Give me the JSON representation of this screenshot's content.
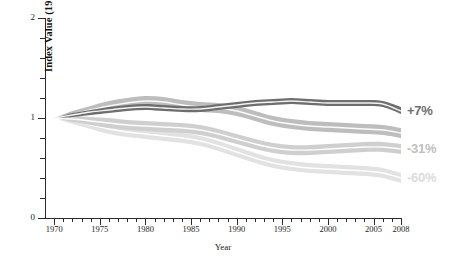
{
  "chart_data": {
    "type": "area",
    "title": "",
    "subtitle": "",
    "xlabel": "Year",
    "ylabel": "Index Value (1970 = 1)",
    "xlim": [
      1969,
      2008
    ],
    "ylim": [
      0,
      2
    ],
    "grid": false,
    "legend_position": "right-endpoint-labels",
    "y_ticks_major": [
      0,
      1,
      2
    ],
    "y_tick_labels": [
      "0",
      "1",
      "2"
    ],
    "y_ticks_minor": [
      0.2,
      0.4,
      0.6,
      0.8,
      1.2,
      1.4,
      1.6,
      1.8
    ],
    "x_ticks_major": [
      1970,
      1975,
      1980,
      1985,
      1990,
      1995,
      2000,
      2005,
      2008
    ],
    "x_tick_labels": [
      "1970",
      "1975",
      "1980",
      "1985",
      "1990",
      "1995",
      "2000",
      "2005",
      "2008"
    ],
    "x_ticks_minor_step": 1,
    "x": [
      1970,
      1972,
      1974,
      1976,
      1978,
      1980,
      1982,
      1984,
      1986,
      1988,
      1990,
      1992,
      1994,
      1996,
      1998,
      2000,
      2002,
      2004,
      2006,
      2008
    ],
    "series": [
      {
        "name": "band-1",
        "end_label": "+7%",
        "color": "#6e6e6e",
        "band_color": "#6e6e6e",
        "line_color": "#f2f2f2",
        "values": [
          1.0,
          1.03,
          1.06,
          1.08,
          1.1,
          1.11,
          1.1,
          1.09,
          1.09,
          1.11,
          1.13,
          1.15,
          1.16,
          1.17,
          1.16,
          1.15,
          1.15,
          1.15,
          1.14,
          1.07
        ],
        "band_lower": [
          1.0,
          1.01,
          1.03,
          1.05,
          1.07,
          1.08,
          1.07,
          1.06,
          1.06,
          1.08,
          1.1,
          1.12,
          1.13,
          1.14,
          1.13,
          1.12,
          1.12,
          1.12,
          1.11,
          1.04
        ],
        "band_upper": [
          1.0,
          1.05,
          1.08,
          1.11,
          1.13,
          1.14,
          1.13,
          1.12,
          1.12,
          1.14,
          1.16,
          1.18,
          1.19,
          1.2,
          1.19,
          1.18,
          1.18,
          1.18,
          1.17,
          1.11
        ]
      },
      {
        "name": "band-2",
        "end_label": "",
        "color": "#bdbdbd",
        "band_color": "#bdbdbd",
        "line_color": "#fbfbfb",
        "values": [
          1.0,
          1.04,
          1.08,
          1.12,
          1.15,
          1.17,
          1.16,
          1.13,
          1.11,
          1.1,
          1.07,
          1.02,
          0.97,
          0.94,
          0.92,
          0.91,
          0.9,
          0.89,
          0.88,
          0.85
        ],
        "band_lower": [
          1.0,
          1.01,
          1.04,
          1.07,
          1.1,
          1.12,
          1.11,
          1.08,
          1.06,
          1.05,
          1.02,
          0.97,
          0.92,
          0.89,
          0.87,
          0.86,
          0.85,
          0.84,
          0.83,
          0.8
        ],
        "band_upper": [
          1.0,
          1.07,
          1.12,
          1.17,
          1.2,
          1.22,
          1.21,
          1.18,
          1.16,
          1.15,
          1.12,
          1.07,
          1.02,
          0.99,
          0.97,
          0.96,
          0.95,
          0.94,
          0.93,
          0.9
        ]
      },
      {
        "name": "band-3",
        "end_label": "-31%",
        "color": "#cfcfcf",
        "band_color": "#cfcfcf",
        "line_color": "#fdfdfd",
        "values": [
          1.0,
          0.99,
          0.97,
          0.95,
          0.93,
          0.92,
          0.91,
          0.9,
          0.88,
          0.84,
          0.79,
          0.74,
          0.7,
          0.68,
          0.68,
          0.69,
          0.7,
          0.71,
          0.71,
          0.69
        ],
        "band_lower": [
          1.0,
          0.96,
          0.93,
          0.9,
          0.88,
          0.87,
          0.86,
          0.85,
          0.83,
          0.79,
          0.74,
          0.69,
          0.65,
          0.63,
          0.63,
          0.64,
          0.65,
          0.66,
          0.66,
          0.64
        ],
        "band_upper": [
          1.0,
          1.02,
          1.01,
          1.0,
          0.98,
          0.97,
          0.96,
          0.95,
          0.93,
          0.89,
          0.84,
          0.79,
          0.75,
          0.73,
          0.73,
          0.74,
          0.75,
          0.76,
          0.76,
          0.74
        ]
      },
      {
        "name": "band-4",
        "end_label": "-60%",
        "color": "#e2e2e2",
        "band_color": "#e2e2e2",
        "line_color": "#ffffff",
        "values": [
          1.0,
          0.97,
          0.93,
          0.89,
          0.86,
          0.84,
          0.82,
          0.8,
          0.77,
          0.72,
          0.66,
          0.6,
          0.55,
          0.52,
          0.5,
          0.49,
          0.48,
          0.47,
          0.45,
          0.4
        ],
        "band_lower": [
          1.0,
          0.94,
          0.89,
          0.84,
          0.81,
          0.79,
          0.77,
          0.75,
          0.72,
          0.67,
          0.61,
          0.55,
          0.5,
          0.47,
          0.45,
          0.44,
          0.43,
          0.42,
          0.4,
          0.35
        ],
        "band_upper": [
          1.0,
          1.0,
          0.97,
          0.94,
          0.91,
          0.89,
          0.87,
          0.85,
          0.82,
          0.77,
          0.71,
          0.65,
          0.6,
          0.57,
          0.55,
          0.54,
          0.53,
          0.52,
          0.5,
          0.45
        ]
      }
    ]
  },
  "colors": {
    "axis": "#2b2b2b",
    "text": "#1c1c1c",
    "background": "#ffffff",
    "label_plus7": "#6e6e6e",
    "label_minus31": "#c0c0c0",
    "label_minus60": "#dcdcdc"
  }
}
